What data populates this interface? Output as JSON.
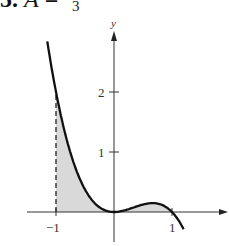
{
  "header": {
    "problem_number": "5.",
    "equation_lhs": "A",
    "equation_eq": "=",
    "fraction_denominator": "3"
  },
  "chart_data": {
    "type": "line",
    "title": "",
    "function": "y = x^2 - x^3",
    "xlabel": "",
    "ylabel": "y",
    "x_ticks": [
      {
        "value": -1,
        "label": "−1"
      },
      {
        "value": 1,
        "label": "1"
      }
    ],
    "y_ticks": [
      {
        "value": 1,
        "label": "1"
      },
      {
        "value": 2,
        "label": "2"
      }
    ],
    "xlim": [
      -1.5,
      1.95
    ],
    "ylim": [
      -0.57,
      3.0
    ],
    "grid": false,
    "legend": null,
    "shaded_region": {
      "from_x": -1,
      "to_x": 1,
      "description": "area between curve and x-axis",
      "fill": "#d9d9d9"
    },
    "dashed_line": {
      "x": -1,
      "from_y": 0,
      "to_y": 2
    },
    "curve_points": [
      {
        "x": -1.15,
        "y": 2.84
      },
      {
        "x": -1.0,
        "y": 2.0
      },
      {
        "x": -0.75,
        "y": 0.984
      },
      {
        "x": -0.5,
        "y": 0.375
      },
      {
        "x": -0.25,
        "y": 0.078
      },
      {
        "x": 0.0,
        "y": 0.0
      },
      {
        "x": 0.25,
        "y": 0.047
      },
      {
        "x": 0.5,
        "y": 0.125
      },
      {
        "x": 0.667,
        "y": 0.148
      },
      {
        "x": 0.85,
        "y": 0.108
      },
      {
        "x": 1.0,
        "y": 0.0
      },
      {
        "x": 1.2,
        "y": -0.288
      }
    ],
    "colors": {
      "curve": "#111111",
      "axes": "#333333",
      "fill": "#d9d9d9"
    }
  }
}
